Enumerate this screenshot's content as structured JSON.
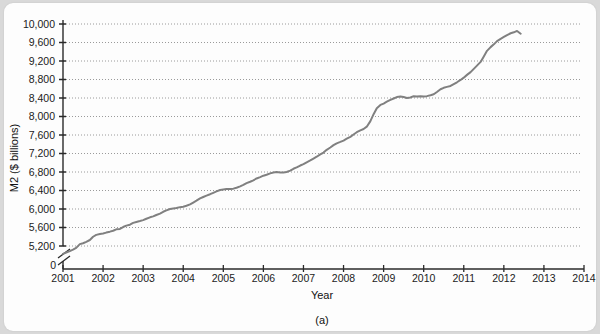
{
  "figure": {
    "panel_caption": "(a)",
    "background_color": "#d9d9d9",
    "card_color": "#fdfdfd"
  },
  "chart_data": {
    "type": "line",
    "title": "",
    "subtitle": "",
    "xlabel": "Year",
    "ylabel": "M2 ($ billions)",
    "xlim": [
      2001,
      2014
    ],
    "ylim": [
      5200,
      10000
    ],
    "y_axis_break": true,
    "y_zero_label": "0",
    "grid": true,
    "grid_style": "dotted",
    "legend": "none",
    "line_color": "#808080",
    "line_width": 2.0,
    "xticks": [
      2001,
      2002,
      2003,
      2004,
      2005,
      2006,
      2007,
      2008,
      2009,
      2010,
      2011,
      2012,
      2013,
      2014
    ],
    "xtick_labels": [
      "2001",
      "2002",
      "2003",
      "2004",
      "2005",
      "2006",
      "2007",
      "2008",
      "2009",
      "2010",
      "2011",
      "2012",
      "2013",
      "2014"
    ],
    "yticks": [
      5200,
      5600,
      6000,
      6400,
      6800,
      7200,
      7600,
      8000,
      8400,
      8800,
      9200,
      9600,
      10000
    ],
    "ytick_labels": [
      "5,200",
      "5,600",
      "6,000",
      "6,400",
      "6,800",
      "7,200",
      "7,600",
      "8,000",
      "8,400",
      "8,800",
      "9,200",
      "9,600",
      "10,000"
    ],
    "series": [
      {
        "name": "M2 money stock",
        "x": [
          2001.0,
          2001.08,
          2001.17,
          2001.25,
          2001.33,
          2001.42,
          2001.5,
          2001.58,
          2001.67,
          2001.75,
          2001.83,
          2001.92,
          2002.0,
          2002.08,
          2002.17,
          2002.25,
          2002.33,
          2002.42,
          2002.5,
          2002.58,
          2002.67,
          2002.75,
          2002.83,
          2002.92,
          2003.0,
          2003.08,
          2003.17,
          2003.25,
          2003.33,
          2003.42,
          2003.5,
          2003.58,
          2003.67,
          2003.75,
          2003.83,
          2003.92,
          2004.0,
          2004.08,
          2004.17,
          2004.25,
          2004.33,
          2004.42,
          2004.5,
          2004.58,
          2004.67,
          2004.75,
          2004.83,
          2004.92,
          2005.0,
          2005.08,
          2005.17,
          2005.25,
          2005.33,
          2005.42,
          2005.5,
          2005.58,
          2005.67,
          2005.75,
          2005.83,
          2005.92,
          2006.0,
          2006.08,
          2006.17,
          2006.25,
          2006.33,
          2006.42,
          2006.5,
          2006.58,
          2006.67,
          2006.75,
          2006.83,
          2006.92,
          2007.0,
          2007.08,
          2007.17,
          2007.25,
          2007.33,
          2007.42,
          2007.5,
          2007.58,
          2007.67,
          2007.75,
          2007.83,
          2007.92,
          2008.0,
          2008.08,
          2008.17,
          2008.25,
          2008.33,
          2008.42,
          2008.5,
          2008.58,
          2008.67,
          2008.75,
          2008.83,
          2008.92,
          2009.0,
          2009.08,
          2009.17,
          2009.25,
          2009.33,
          2009.42,
          2009.5,
          2009.58,
          2009.67,
          2009.75,
          2009.83,
          2009.92,
          2010.0,
          2010.08,
          2010.17,
          2010.25,
          2010.33,
          2010.42,
          2010.5,
          2010.58,
          2010.67,
          2010.75,
          2010.83,
          2010.92,
          2011.0,
          2011.08,
          2011.17,
          2011.25,
          2011.33,
          2011.42,
          2011.5,
          2011.58,
          2011.67,
          2011.75,
          2011.83,
          2011.92,
          2012.0,
          2012.08,
          2012.17,
          2012.25,
          2012.33,
          2012.42
        ],
        "y": [
          5030,
          5060,
          5090,
          5120,
          5160,
          5240,
          5260,
          5290,
          5330,
          5400,
          5440,
          5460,
          5470,
          5490,
          5510,
          5530,
          5560,
          5570,
          5610,
          5640,
          5660,
          5700,
          5720,
          5740,
          5760,
          5790,
          5820,
          5840,
          5870,
          5900,
          5940,
          5970,
          6000,
          6010,
          6020,
          6040,
          6050,
          6070,
          6100,
          6140,
          6180,
          6230,
          6260,
          6290,
          6320,
          6350,
          6380,
          6410,
          6420,
          6430,
          6430,
          6440,
          6460,
          6490,
          6520,
          6560,
          6590,
          6620,
          6660,
          6690,
          6720,
          6740,
          6770,
          6790,
          6800,
          6790,
          6790,
          6800,
          6830,
          6870,
          6900,
          6940,
          6970,
          7010,
          7050,
          7090,
          7130,
          7180,
          7220,
          7280,
          7330,
          7380,
          7420,
          7450,
          7480,
          7520,
          7560,
          7610,
          7660,
          7700,
          7730,
          7780,
          7900,
          8050,
          8180,
          8250,
          8280,
          8320,
          8360,
          8390,
          8420,
          8430,
          8420,
          8400,
          8410,
          8440,
          8430,
          8440,
          8430,
          8440,
          8460,
          8480,
          8530,
          8590,
          8620,
          8640,
          8660,
          8700,
          8740,
          8790,
          8840,
          8900,
          8960,
          9030,
          9100,
          9180,
          9300,
          9420,
          9500,
          9560,
          9630,
          9680,
          9720,
          9760,
          9800,
          9820,
          9850,
          9790
        ]
      }
    ]
  }
}
